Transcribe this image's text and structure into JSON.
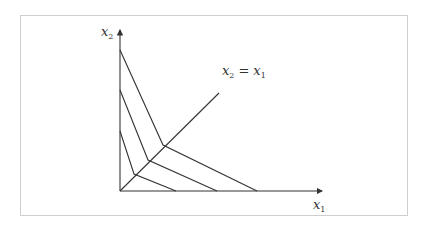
{
  "diagram": {
    "type": "indifference-curves-kinked",
    "axes": {
      "x": {
        "base": "x",
        "sub": "1"
      },
      "y": {
        "base": "x",
        "sub": "2"
      }
    },
    "diagonal_label": {
      "lhs_base": "x",
      "lhs_sub": "2",
      "eq": "=",
      "rhs_base": "x",
      "rhs_sub": "1"
    },
    "colors": {
      "line": "#333333",
      "frame": "#cfcfcf",
      "background": "#ffffff"
    },
    "curves": [
      {
        "y_intercept_px": [
          120,
          131
        ],
        "kink_px": [
          134,
          174
        ],
        "x_intercept_px": [
          176,
          191
        ]
      },
      {
        "y_intercept_px": [
          120,
          90
        ],
        "kink_px": [
          148,
          160
        ],
        "x_intercept_px": [
          217,
          191
        ]
      },
      {
        "y_intercept_px": [
          120,
          50
        ],
        "kink_px": [
          163,
          145
        ],
        "x_intercept_px": [
          257,
          191
        ]
      }
    ],
    "origin_px": [
      120,
      191
    ],
    "diagonal_end_px": [
      219,
      93
    ]
  }
}
